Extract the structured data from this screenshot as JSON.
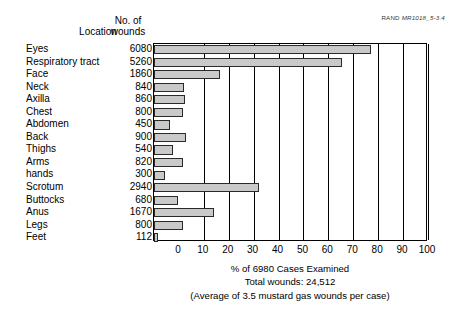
{
  "source_tag": {
    "prefix": "RAND ",
    "code": "MR1018_5-3.4"
  },
  "headers": {
    "location": "Location",
    "wounds_line1": "No. of",
    "wounds_line2": "wounds"
  },
  "caption": {
    "line1": "% of 6980 Cases Examined",
    "line2": "Total wounds: 24,512",
    "line3": "(Average of 3.5 mustard gas wounds per case)"
  },
  "chart_data": {
    "type": "bar",
    "orientation": "horizontal",
    "title": "",
    "xlabel": "% of 6980 Cases Examined",
    "ylabel": "Location",
    "xlim": [
      0,
      100
    ],
    "xticks": [
      0,
      10,
      20,
      30,
      40,
      50,
      60,
      70,
      80,
      90,
      100
    ],
    "grid": true,
    "legend": null,
    "total_cases": 6980,
    "total_wounds": 24512,
    "average_wounds_per_case": 3.5,
    "value_label": "No. of wounds",
    "categories": [
      "Eyes",
      "Respiratory tract",
      "Face",
      "Neck",
      "Axilla",
      "Chest",
      "Abdomen",
      "Back",
      "Thighs",
      "Arms",
      "hands",
      "Scrotum",
      "Buttocks",
      "Anus",
      "Legs",
      "Feet"
    ],
    "values": [
      6080,
      5260,
      1860,
      840,
      860,
      800,
      450,
      900,
      540,
      820,
      300,
      2940,
      680,
      1670,
      800,
      112
    ],
    "percents": [
      87.1,
      75.4,
      26.6,
      12.0,
      12.3,
      11.5,
      6.4,
      12.9,
      7.7,
      11.7,
      4.3,
      42.1,
      9.7,
      23.9,
      11.5,
      1.6
    ],
    "bar_fill_color": "#c9c9c9",
    "bar_border_color": "#2a2a2a",
    "axis_color": "#000000"
  }
}
